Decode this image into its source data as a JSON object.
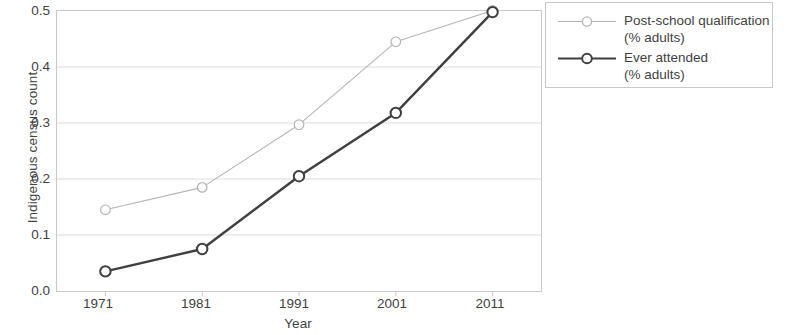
{
  "chart_data": {
    "type": "line",
    "title": "",
    "xlabel": "Year",
    "ylabel": "Indigenous census count",
    "x": [
      1971,
      1981,
      1991,
      2001,
      2011
    ],
    "xticklabels": [
      "1971",
      "1981",
      "1991",
      "2001",
      "2011"
    ],
    "yticklabels": [
      "0.0",
      "0.1",
      "0.2",
      "0.3",
      "0.4",
      "0.5"
    ],
    "yticks": [
      0.0,
      0.1,
      0.2,
      0.3,
      0.4,
      0.5
    ],
    "xlim": [
      1966,
      2016
    ],
    "ylim": [
      0.0,
      0.5
    ],
    "grid": "horizontal",
    "legend_position": "right",
    "series": [
      {
        "name": "Post-school qualification\n(% adults)",
        "values": [
          0.145,
          0.185,
          0.297,
          0.445,
          0.501
        ],
        "color": "#b4b4b4",
        "line_width": 1.1,
        "marker": "open-circle"
      },
      {
        "name": "Ever attended\n(% adults)",
        "values": [
          0.035,
          0.075,
          0.205,
          0.318,
          0.498
        ],
        "color": "#3f3f3f",
        "line_width": 2.4,
        "marker": "open-circle"
      }
    ]
  },
  "legend": {
    "entries": [
      {
        "label": "Post-school qualification\n(% adults)"
      },
      {
        "label": "Ever attended\n(% adults)"
      }
    ]
  },
  "colors": {
    "background": "#ffffff",
    "axis": "#c9c9c9",
    "grid": "#dcdcdc",
    "text": "#3f3f3f",
    "series_light": "#b4b4b4",
    "series_dark": "#3f3f3f"
  }
}
